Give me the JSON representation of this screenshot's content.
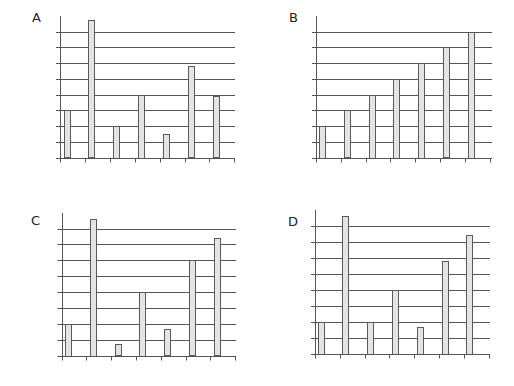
{
  "chart_data": [
    {
      "type": "bar",
      "title": "A",
      "categories": [
        "1",
        "2",
        "3",
        "4",
        "5",
        "6",
        "7"
      ],
      "values": [
        3,
        8.7,
        2,
        4,
        1.5,
        5.8,
        3.9
      ],
      "xlabel": "",
      "ylabel": "",
      "ylim": [
        0,
        8
      ],
      "yticks": [
        0,
        1,
        2,
        3,
        4,
        5,
        6,
        7,
        8
      ],
      "tick_labels_shown": false,
      "grid": true,
      "legend": "none"
    },
    {
      "type": "bar",
      "title": "B",
      "categories": [
        "1",
        "2",
        "3",
        "4",
        "5",
        "6",
        "7"
      ],
      "values": [
        2,
        3,
        4,
        5,
        6,
        7,
        8
      ],
      "xlabel": "",
      "ylabel": "",
      "ylim": [
        0,
        8
      ],
      "yticks": [
        0,
        1,
        2,
        3,
        4,
        5,
        6,
        7,
        8
      ],
      "tick_labels_shown": false,
      "grid": true,
      "legend": "none"
    },
    {
      "type": "bar",
      "title": "C",
      "categories": [
        "1",
        "2",
        "3",
        "4",
        "5",
        "6",
        "7"
      ],
      "values": [
        2,
        8.6,
        0.7,
        4,
        1.65,
        6,
        7.4
      ],
      "xlabel": "",
      "ylabel": "",
      "ylim": [
        0,
        8
      ],
      "yticks": [
        0,
        1,
        2,
        3,
        4,
        5,
        6,
        7,
        8
      ],
      "tick_labels_shown": false,
      "grid": true,
      "legend": "none"
    },
    {
      "type": "bar",
      "title": "D",
      "categories": [
        "1",
        "2",
        "3",
        "4",
        "5",
        "6",
        "7"
      ],
      "values": [
        2,
        8.6,
        2,
        4,
        1.65,
        5.8,
        7.4
      ],
      "xlabel": "",
      "ylabel": "",
      "ylim": [
        0,
        8
      ],
      "yticks": [
        0,
        1,
        2,
        3,
        4,
        5,
        6,
        7,
        8
      ],
      "tick_labels_shown": false,
      "grid": true,
      "legend": "none"
    }
  ],
  "colors": {
    "bar_fill": "#e4e4e4",
    "bar_stroke": "#5a5a5a",
    "grid": "#555555"
  }
}
